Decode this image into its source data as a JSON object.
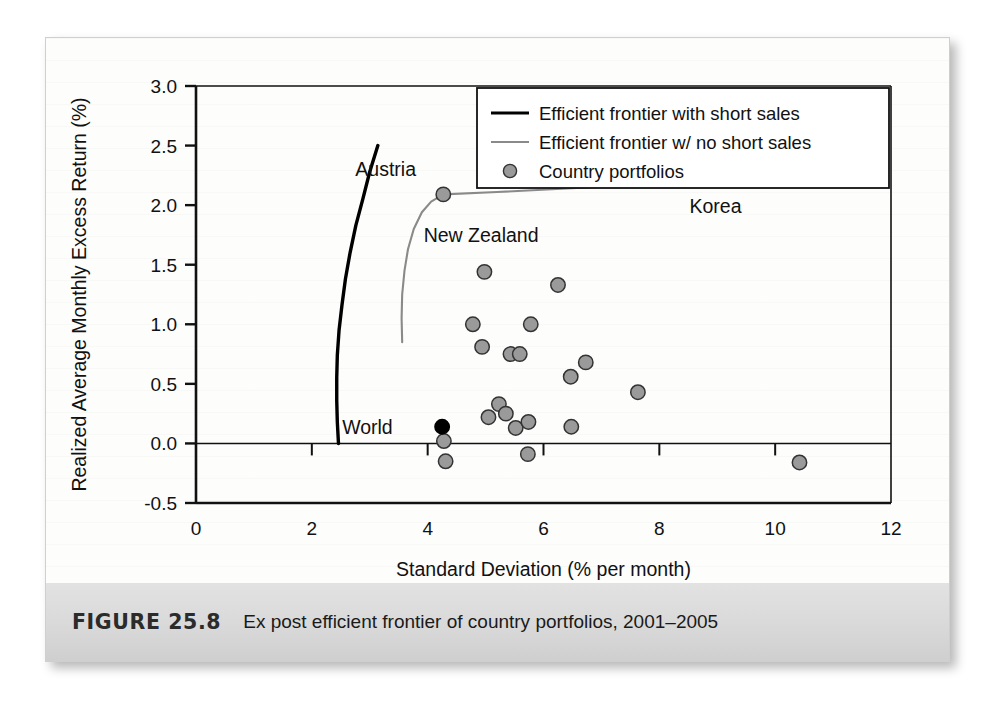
{
  "figure": {
    "caption_label": "FIGURE 25.8",
    "caption_text": "Ex post efficient frontier of country portfolios, 2001–2005"
  },
  "chart_data": {
    "type": "scatter",
    "title": "",
    "xlabel": "Standard Deviation (% per month)",
    "ylabel": "Realized Average Monthly Excess Return (%)",
    "xlim": [
      0,
      12
    ],
    "ylim": [
      -0.5,
      3.0
    ],
    "xticks": [
      0,
      2,
      4,
      6,
      8,
      10,
      12
    ],
    "xtick_labels": [
      "0",
      "2",
      "4",
      "6",
      "8",
      "10",
      "12"
    ],
    "yticks": [
      -0.5,
      0.0,
      0.5,
      1.0,
      1.5,
      2.0,
      2.5,
      3.0
    ],
    "ytick_labels": [
      "-0.5",
      "0.0",
      "0.5",
      "1.0",
      "1.5",
      "2.0",
      "2.5",
      "3.0"
    ],
    "grid": false,
    "zero_line": true,
    "legend_position": "top-right",
    "legend": [
      {
        "label": "Efficient frontier with short sales",
        "marker": "line",
        "color": "#000000",
        "width": 3.2
      },
      {
        "label": "Efficient frontier w/ no short sales",
        "marker": "line",
        "color": "#8a8a8a",
        "width": 2.0
      },
      {
        "label": "Country portfolios",
        "marker": "circle",
        "color": "#9a9a9a",
        "edge": "#333333"
      }
    ],
    "series": [
      {
        "name": "Efficient frontier with short sales",
        "type": "line",
        "color": "#000000",
        "points": [
          [
            2.46,
            0.0
          ],
          [
            2.44,
            0.18
          ],
          [
            2.43,
            0.36
          ],
          [
            2.43,
            0.55
          ],
          [
            2.44,
            0.74
          ],
          [
            2.47,
            0.95
          ],
          [
            2.52,
            1.16
          ],
          [
            2.58,
            1.38
          ],
          [
            2.66,
            1.6
          ],
          [
            2.76,
            1.83
          ],
          [
            2.88,
            2.05
          ],
          [
            3.0,
            2.28
          ],
          [
            3.14,
            2.5
          ]
        ]
      },
      {
        "name": "Efficient frontier w/ no short sales",
        "type": "line",
        "color": "#8a8a8a",
        "points": [
          [
            3.56,
            0.85
          ],
          [
            3.55,
            1.05
          ],
          [
            3.56,
            1.25
          ],
          [
            3.6,
            1.45
          ],
          [
            3.66,
            1.63
          ],
          [
            3.76,
            1.8
          ],
          [
            3.9,
            1.94
          ],
          [
            4.06,
            2.03
          ],
          [
            4.27,
            2.09
          ],
          [
            5.2,
            2.11
          ],
          [
            6.4,
            2.14
          ],
          [
            7.6,
            2.17
          ],
          [
            8.9,
            2.22
          ]
        ]
      },
      {
        "name": "Country portfolios",
        "type": "scatter",
        "color": "#9a9a9a",
        "edge": "#333333",
        "points": [
          [
            4.27,
            2.09
          ],
          [
            8.9,
            2.22
          ],
          [
            4.98,
            1.44
          ],
          [
            6.25,
            1.33
          ],
          [
            4.78,
            1.0
          ],
          [
            5.78,
            1.0
          ],
          [
            4.94,
            0.81
          ],
          [
            5.43,
            0.75
          ],
          [
            5.59,
            0.75
          ],
          [
            6.73,
            0.68
          ],
          [
            6.47,
            0.56
          ],
          [
            7.63,
            0.43
          ],
          [
            5.23,
            0.33
          ],
          [
            5.35,
            0.25
          ],
          [
            5.05,
            0.22
          ],
          [
            5.52,
            0.13
          ],
          [
            5.74,
            0.18
          ],
          [
            6.48,
            0.14
          ],
          [
            4.28,
            0.02
          ],
          [
            5.73,
            -0.09
          ],
          [
            4.31,
            -0.15
          ],
          [
            10.42,
            -0.16
          ]
        ]
      },
      {
        "name": "World",
        "type": "scatter",
        "color": "#000000",
        "edge": "#000000",
        "points": [
          [
            4.25,
            0.14
          ]
        ]
      }
    ],
    "annotations": [
      {
        "text": "Austria",
        "x": 4.27,
        "y": 2.09,
        "dx": -88,
        "dy": -18,
        "anchor": "start"
      },
      {
        "text": "Korea",
        "x": 8.9,
        "y": 2.22,
        "dx": -22,
        "dy": 34,
        "anchor": "start"
      },
      {
        "text": "New Zealand",
        "x": 3.62,
        "y": 1.62,
        "dx": 18,
        "dy": -8,
        "anchor": "start"
      },
      {
        "text": "World",
        "x": 4.25,
        "y": 0.14,
        "dx": -100,
        "dy": 7,
        "anchor": "start"
      }
    ]
  }
}
